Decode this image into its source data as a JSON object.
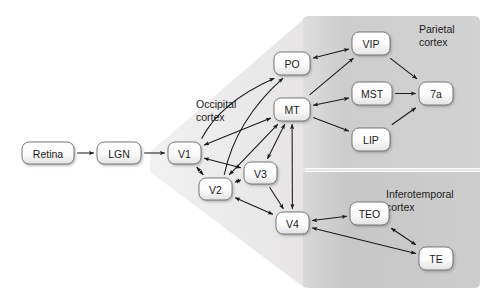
{
  "figure": {
    "background_color": "#ffffff"
  },
  "regions": [
    {
      "id": "occipital",
      "label_line1": "Occipital",
      "label_line2": "cortex",
      "fill": "#eceaea",
      "label_x": 196,
      "label_y": 108
    },
    {
      "id": "parietal",
      "label_line1": "Parietal",
      "label_line2": "cortex",
      "fill": "#cfcfcf",
      "label_x": 419,
      "label_y": 33
    },
    {
      "id": "inferotemporal",
      "label_line1": "Inferotemporal",
      "label_line2": "cortex",
      "fill": "#c9c9c9",
      "label_x": 386,
      "label_y": 198
    }
  ],
  "nodes": [
    {
      "id": "retina",
      "label": "Retina",
      "x": 22,
      "y": 142,
      "w": 52,
      "h": 22
    },
    {
      "id": "lgn",
      "label": "LGN",
      "x": 97,
      "y": 142,
      "w": 44,
      "h": 22
    },
    {
      "id": "v1",
      "label": "V1",
      "x": 168,
      "y": 142,
      "w": 33,
      "h": 22
    },
    {
      "id": "v2",
      "label": "V2",
      "x": 199,
      "y": 178,
      "w": 33,
      "h": 22
    },
    {
      "id": "v3",
      "label": "V3",
      "x": 244,
      "y": 162,
      "w": 33,
      "h": 22
    },
    {
      "id": "v4",
      "label": "V4",
      "x": 276,
      "y": 212,
      "w": 33,
      "h": 22
    },
    {
      "id": "mt",
      "label": "MT",
      "x": 274,
      "y": 98,
      "w": 36,
      "h": 23
    },
    {
      "id": "po",
      "label": "PO",
      "x": 274,
      "y": 52,
      "w": 36,
      "h": 23
    },
    {
      "id": "vip",
      "label": "VIP",
      "x": 352,
      "y": 32,
      "w": 38,
      "h": 23
    },
    {
      "id": "mst",
      "label": "MST",
      "x": 352,
      "y": 82,
      "w": 40,
      "h": 23
    },
    {
      "id": "lip",
      "label": "LIP",
      "x": 352,
      "y": 128,
      "w": 38,
      "h": 23
    },
    {
      "id": "7a",
      "label": "7a",
      "x": 419,
      "y": 82,
      "w": 34,
      "h": 23
    },
    {
      "id": "teo",
      "label": "TEO",
      "x": 350,
      "y": 202,
      "w": 39,
      "h": 23
    },
    {
      "id": "te",
      "label": "TE",
      "x": 419,
      "y": 247,
      "w": 34,
      "h": 23
    }
  ],
  "edges": [
    {
      "from": "retina",
      "to": "lgn",
      "arrow": "forward"
    },
    {
      "from": "lgn",
      "to": "v1",
      "arrow": "forward"
    },
    {
      "from": "v1",
      "to": "v2",
      "arrow": "both"
    },
    {
      "from": "v1",
      "to": "v3",
      "arrow": "both"
    },
    {
      "from": "v1",
      "to": "mt",
      "arrow": "both"
    },
    {
      "from": "v1",
      "to": "po",
      "arrow": "forward"
    },
    {
      "from": "v2",
      "to": "v3",
      "arrow": "both"
    },
    {
      "from": "v2",
      "to": "v4",
      "arrow": "both"
    },
    {
      "from": "v2",
      "to": "mt",
      "arrow": "both"
    },
    {
      "from": "v2",
      "to": "po",
      "arrow": "forward"
    },
    {
      "from": "v3",
      "to": "mt",
      "arrow": "both"
    },
    {
      "from": "v3",
      "to": "v4",
      "arrow": "forward"
    },
    {
      "from": "mt",
      "to": "v4",
      "arrow": "both"
    },
    {
      "from": "mt",
      "to": "vip",
      "arrow": "forward"
    },
    {
      "from": "mt",
      "to": "mst",
      "arrow": "both"
    },
    {
      "from": "mt",
      "to": "lip",
      "arrow": "forward"
    },
    {
      "from": "po",
      "to": "vip",
      "arrow": "both"
    },
    {
      "from": "vip",
      "to": "7a",
      "arrow": "forward"
    },
    {
      "from": "mst",
      "to": "7a",
      "arrow": "forward"
    },
    {
      "from": "lip",
      "to": "7a",
      "arrow": "forward"
    },
    {
      "from": "v4",
      "to": "teo",
      "arrow": "both"
    },
    {
      "from": "v4",
      "to": "te",
      "arrow": "both"
    },
    {
      "from": "teo",
      "to": "te",
      "arrow": "both"
    }
  ]
}
